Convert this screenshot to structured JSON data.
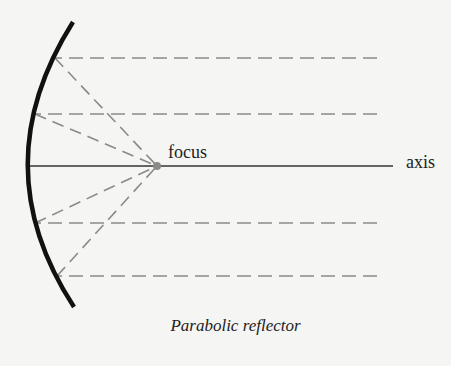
{
  "labels": {
    "focus": "focus",
    "axis": "axis",
    "caption": "Parabolic reflector"
  },
  "colors": {
    "reflector": "#111111",
    "axis": "#333333",
    "rays": "#8a8a8a",
    "background": "#f5f5f3"
  },
  "geometry": {
    "vertex": [
      27,
      166
    ],
    "focus": [
      157,
      166
    ],
    "reflector_ends": [
      [
        73,
        22
      ],
      [
        74,
        307
      ]
    ],
    "ray_hits": [
      [
        55,
        58
      ],
      [
        35,
        114
      ],
      [
        35,
        223
      ],
      [
        57,
        276
      ]
    ],
    "ray_end_x": 377,
    "axis_end_x": 393
  }
}
